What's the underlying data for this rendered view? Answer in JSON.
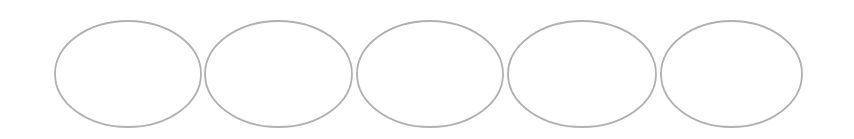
{
  "diagram": {
    "background": "#ffffff",
    "stroke_color": "#b0b0b0",
    "stroke_width": 1.8,
    "shapes": [
      {
        "type": "ellipse",
        "cx": 128,
        "cy": 74,
        "rx": 73,
        "ry": 53
      },
      {
        "type": "ellipse",
        "cx": 278.5,
        "cy": 74,
        "rx": 73.5,
        "ry": 53
      },
      {
        "type": "ellipse",
        "cx": 430,
        "cy": 74,
        "rx": 73,
        "ry": 53
      },
      {
        "type": "ellipse",
        "cx": 582,
        "cy": 74,
        "rx": 74,
        "ry": 53
      },
      {
        "type": "ellipse",
        "cx": 731.5,
        "cy": 74,
        "rx": 70.5,
        "ry": 53
      }
    ]
  }
}
